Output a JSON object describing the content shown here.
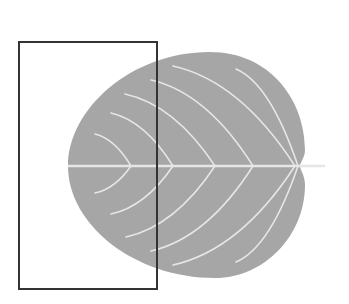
{
  "figure": {
    "width": 349,
    "height": 304,
    "background": "#ffffff",
    "leaf": {
      "fill": "#a6a6a6",
      "vein_color": "#e6e6e6",
      "midrib": {
        "x1": 68,
        "y1": 166,
        "x2": 325,
        "y2": 166
      },
      "vein_pairs": [
        {
          "join_x": 131,
          "top": [
            95,
            134
          ],
          "bottom": [
            95,
            193
          ]
        },
        {
          "join_x": 173,
          "top": [
            111,
            113
          ],
          "bottom": [
            111,
            214
          ]
        },
        {
          "join_x": 215,
          "top": [
            125,
            94
          ],
          "bottom": [
            126,
            237
          ]
        },
        {
          "join_x": 253,
          "top": [
            151,
            80
          ],
          "bottom": [
            151,
            251
          ]
        },
        {
          "join_x": 295,
          "top": [
            173,
            66
          ],
          "bottom": [
            173,
            265
          ]
        },
        {
          "join_x": 298,
          "top": [
            236,
            69
          ],
          "bottom": [
            236,
            262
          ]
        }
      ]
    },
    "frame": {
      "x": 19,
      "y": 42,
      "width": 138,
      "height": 247,
      "stroke": "#333333",
      "stroke_width": 2
    }
  }
}
